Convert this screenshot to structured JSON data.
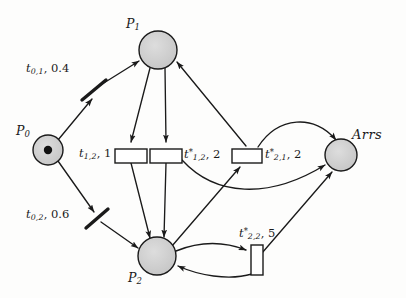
{
  "figure": {
    "background_color": "#fdfdfc",
    "stroke_color": "#1a1a1a",
    "place_fill_color": "#cccccc",
    "transition_fill_color": "#ffffff"
  },
  "places": [
    {
      "id": "P0",
      "label": "P",
      "subscript": "0",
      "cx": 48,
      "cy": 150,
      "r": 15,
      "tokens": 1,
      "label_x": 16,
      "label_y": 125
    },
    {
      "id": "P1",
      "label": "P",
      "subscript": "1",
      "cx": 158,
      "cy": 50,
      "r": 19,
      "tokens": 0,
      "label_x": 126,
      "label_y": 18
    },
    {
      "id": "P2",
      "label": "P",
      "subscript": "2",
      "cx": 157,
      "cy": 256,
      "r": 19,
      "tokens": 0,
      "label_x": 128,
      "label_y": 272
    },
    {
      "id": "Arrs",
      "label": "Arrs",
      "subscript": "",
      "cx": 341,
      "cy": 155,
      "r": 16,
      "tokens": 0,
      "label_x": 352,
      "label_y": 128
    }
  ],
  "transitions": [
    {
      "id": "t01",
      "kind": "immediate-bar",
      "name": "t",
      "subscript": "0,1",
      "star": false,
      "rate": "0.4",
      "label_x": 26,
      "label_y": 63,
      "x": 93,
      "y": 91,
      "angle": -62
    },
    {
      "id": "t02",
      "kind": "immediate-bar",
      "name": "t",
      "subscript": "0,2",
      "star": false,
      "rate": "0.6",
      "label_x": 26,
      "label_y": 209,
      "x": 95,
      "y": 219,
      "angle": -62
    },
    {
      "id": "t12",
      "kind": "box-h",
      "name": "t",
      "subscript": "1,2",
      "star": false,
      "rate": "1",
      "label_x": 79,
      "label_y": 148,
      "x": 115,
      "y": 149,
      "w": 32,
      "h": 14
    },
    {
      "id": "t12s",
      "kind": "box-h",
      "name": "t",
      "subscript": "1,2",
      "star": true,
      "rate": "2",
      "label_x": 181,
      "label_y": 148,
      "x": 150,
      "y": 149,
      "w": 32,
      "h": 14
    },
    {
      "id": "t21s",
      "kind": "box-h",
      "name": "t",
      "subscript": "2,1",
      "star": true,
      "rate": "2",
      "label_x": 265,
      "label_y": 148,
      "x": 232,
      "y": 149,
      "w": 30,
      "h": 14
    },
    {
      "id": "t22s",
      "kind": "box-v",
      "name": "t",
      "subscript": "2,2",
      "star": true,
      "rate": "5",
      "label_x": 239,
      "label_y": 229,
      "x": 251,
      "y": 245,
      "w": 12,
      "h": 30
    }
  ],
  "arcs": [
    {
      "from": "P0",
      "to": "t01",
      "type": "input"
    },
    {
      "from": "t01",
      "to": "P1",
      "type": "output"
    },
    {
      "from": "P0",
      "to": "t02",
      "type": "input"
    },
    {
      "from": "t02",
      "to": "P2",
      "type": "output"
    },
    {
      "from": "P1",
      "to": "t12",
      "type": "input"
    },
    {
      "from": "t12",
      "to": "P2",
      "type": "output"
    },
    {
      "from": "P1",
      "to": "t12s",
      "type": "input"
    },
    {
      "from": "t12s",
      "to": "P2",
      "type": "output"
    },
    {
      "from": "t12s",
      "to": "Arrs",
      "type": "output-curved"
    },
    {
      "from": "P2",
      "to": "t21s",
      "type": "input"
    },
    {
      "from": "t21s",
      "to": "P1",
      "type": "output"
    },
    {
      "from": "t21s",
      "to": "Arrs",
      "type": "output-curved"
    },
    {
      "from": "P2",
      "to": "t22s",
      "type": "input-curved"
    },
    {
      "from": "t22s",
      "to": "P2",
      "type": "output-curved"
    },
    {
      "from": "t22s",
      "to": "Arrs",
      "type": "output"
    }
  ]
}
